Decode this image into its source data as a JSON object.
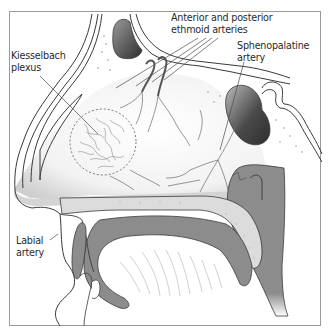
{
  "figure": {
    "frame_color": "#9a9a9a"
  },
  "labels": {
    "kiesselbach": {
      "line1": "Kiesselbach",
      "line2": "plexus"
    },
    "ethmoid": {
      "line1": "Anterior and posterior",
      "line2": "ethmoid arteries"
    },
    "sphenopalatine": {
      "line1": "Sphenopalatine",
      "line2": "artery"
    },
    "labial": {
      "line1": "Labial",
      "line2": "artery"
    }
  },
  "colors": {
    "outline": "#3a3a3a",
    "bone_dark": "#8c8c8c",
    "sinus_dark": "#3c3c3c",
    "mucosa": "#d8d8d8",
    "vessel": "#6a6a6a",
    "stipple": "#bdbdbd"
  }
}
